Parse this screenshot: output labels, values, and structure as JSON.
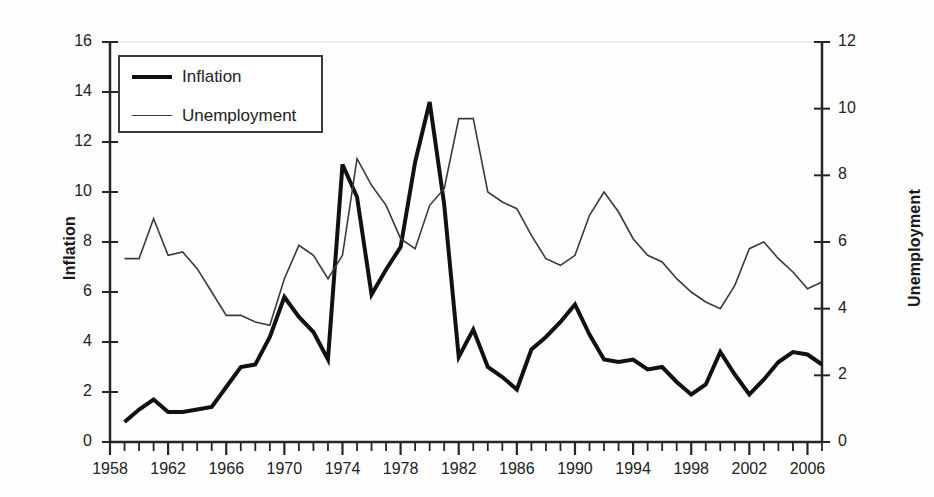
{
  "chart_data": {
    "type": "line",
    "title": "",
    "subtitle": "",
    "xlabel": "",
    "ylabel": "Inflation",
    "y2label": "Unemployment",
    "grid": false,
    "legend_position": "top-left",
    "xlim": [
      1958,
      2007
    ],
    "ylim": [
      0,
      16
    ],
    "y2lim": [
      0,
      12
    ],
    "x_major_ticks": [
      1958,
      1962,
      1966,
      1970,
      1974,
      1978,
      1982,
      1986,
      1990,
      1994,
      1998,
      2002,
      2006
    ],
    "x_minor_tick_step": 1,
    "y_ticks_left": [
      0,
      2,
      4,
      6,
      8,
      10,
      12,
      14,
      16
    ],
    "y_ticks_right": [
      0,
      2,
      4,
      6,
      8,
      10,
      12
    ],
    "x": [
      1959,
      1960,
      1961,
      1962,
      1963,
      1964,
      1965,
      1966,
      1967,
      1968,
      1969,
      1970,
      1971,
      1972,
      1973,
      1974,
      1975,
      1976,
      1977,
      1978,
      1979,
      1980,
      1981,
      1982,
      1983,
      1984,
      1985,
      1986,
      1987,
      1988,
      1989,
      1990,
      1991,
      1992,
      1993,
      1994,
      1995,
      1996,
      1997,
      1998,
      1999,
      2000,
      2001,
      2002,
      2003,
      2004,
      2005,
      2006,
      2007
    ],
    "series": [
      {
        "name": "Inflation",
        "axis": "left",
        "style": "thick",
        "color": "#111111",
        "values": [
          0.8,
          1.3,
          1.7,
          1.2,
          1.2,
          1.3,
          1.4,
          2.2,
          3.0,
          3.1,
          4.2,
          5.8,
          5.0,
          4.4,
          3.3,
          11.1,
          9.8,
          5.9,
          6.9,
          7.8,
          11.2,
          13.6,
          9.5,
          3.4,
          4.5,
          3.0,
          2.6,
          2.1,
          3.7,
          4.2,
          4.8,
          5.5,
          4.3,
          3.3,
          3.2,
          3.3,
          2.9,
          3.0,
          2.4,
          1.9,
          2.3,
          3.6,
          2.7,
          1.9,
          2.5,
          3.2,
          3.6,
          3.5,
          3.1
        ]
      },
      {
        "name": "Unemployment",
        "axis": "right",
        "style": "thin",
        "color": "#3a3a3a",
        "values": [
          5.5,
          5.5,
          6.7,
          5.6,
          5.7,
          5.2,
          4.5,
          3.8,
          3.8,
          3.6,
          3.5,
          4.9,
          5.9,
          5.6,
          4.9,
          5.6,
          8.5,
          7.7,
          7.1,
          6.1,
          5.8,
          7.1,
          7.6,
          9.7,
          9.7,
          7.5,
          7.2,
          7.0,
          6.2,
          5.5,
          5.3,
          5.6,
          6.8,
          7.5,
          6.9,
          6.1,
          5.6,
          5.4,
          4.9,
          4.5,
          4.2,
          4.0,
          4.7,
          5.8,
          6.0,
          5.5,
          5.1,
          4.6,
          4.8
        ]
      }
    ]
  },
  "legend": {
    "entries": [
      {
        "label": "Inflation"
      },
      {
        "label": "Unemployment"
      }
    ]
  },
  "axes": {
    "left_title": "Inflation",
    "right_title": "Unemployment"
  }
}
